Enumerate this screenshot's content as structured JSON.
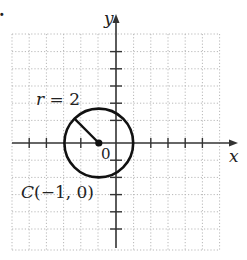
{
  "problem_marker": ".",
  "figure": {
    "type": "circle-on-coordinate-grid",
    "center": {
      "x": -1,
      "y": 0
    },
    "radius": 2,
    "x_range": [
      -6,
      6
    ],
    "y_range": [
      -6,
      6
    ],
    "grid_step": 1
  },
  "labels": {
    "x_axis": "x",
    "y_axis": "y",
    "origin": "0",
    "radius": "r = 2",
    "center": "C(−1, 0)"
  },
  "colors": {
    "axis": "#333333",
    "grid": "#b8b8b8",
    "circle": "#111111"
  }
}
